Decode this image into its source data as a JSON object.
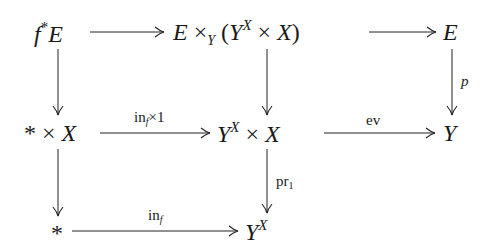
{
  "diagram": {
    "type": "commutative-diagram",
    "nodes": {
      "pullback": {
        "base": "f",
        "sup": "*",
        "tail": "E"
      },
      "fiber_product": {
        "a": "E",
        "times": "×",
        "sub": "Y",
        "open": "(",
        "b": "Y",
        "b_sup": "X",
        "times2": "×",
        "c": "X",
        "close": ")"
      },
      "total": {
        "text": "E"
      },
      "point_times_x": {
        "a": "*",
        "times": "×",
        "b": "X"
      },
      "mapping_times_x": {
        "a": "Y",
        "a_sup": "X",
        "times": "×",
        "b": "X"
      },
      "base": {
        "text": "Y"
      },
      "point": {
        "text": "*"
      },
      "mapping_space": {
        "a": "Y",
        "a_sup": "X"
      }
    },
    "arrows": {
      "top_left": {
        "label": ""
      },
      "top_right": {
        "label": ""
      },
      "mid_left": {
        "label_main": "in",
        "label_sub": "f",
        "label_tail": "×1"
      },
      "mid_right": {
        "label": "ev"
      },
      "bottom": {
        "label_main": "in",
        "label_sub": "f"
      },
      "right_vertical": {
        "label": "p"
      },
      "center_lower_vertical": {
        "label_main": "pr",
        "label_sub": "1"
      },
      "left_upper_vertical": {
        "label": ""
      },
      "left_lower_vertical": {
        "label": ""
      },
      "center_upper_vertical": {
        "label": ""
      }
    }
  }
}
